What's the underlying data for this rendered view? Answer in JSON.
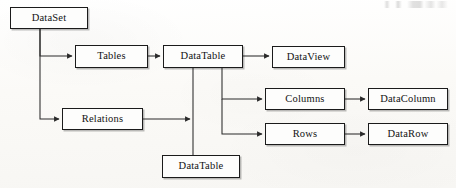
{
  "diagram": {
    "type": "block-flow-diagram",
    "nodes": [
      {
        "id": "dataset",
        "label": "DataSet",
        "x": 10,
        "y": 7,
        "w": 78,
        "h": 22
      },
      {
        "id": "tables",
        "label": "Tables",
        "x": 75,
        "y": 45,
        "w": 73,
        "h": 23
      },
      {
        "id": "datatable",
        "label": "DataTable",
        "x": 163,
        "y": 45,
        "w": 80,
        "h": 23
      },
      {
        "id": "dataview",
        "label": "DataView",
        "x": 272,
        "y": 46,
        "w": 73,
        "h": 22
      },
      {
        "id": "columns",
        "label": "Columns",
        "x": 265,
        "y": 88,
        "w": 80,
        "h": 22
      },
      {
        "id": "datacolumn",
        "label": "DataColumn",
        "x": 368,
        "y": 88,
        "w": 80,
        "h": 22
      },
      {
        "id": "relations",
        "label": "Relations",
        "x": 62,
        "y": 108,
        "w": 81,
        "h": 22
      },
      {
        "id": "rows",
        "label": "Rows",
        "x": 265,
        "y": 123,
        "w": 80,
        "h": 22
      },
      {
        "id": "datarow",
        "label": "DataRow",
        "x": 368,
        "y": 123,
        "w": 80,
        "h": 22
      },
      {
        "id": "datatable2",
        "label": "DataTable",
        "x": 162,
        "y": 155,
        "w": 78,
        "h": 23
      }
    ],
    "edges": [
      {
        "id": "dataset-to-tables",
        "from": "dataset",
        "to": "tables",
        "style": "orthogonal",
        "arrow": true
      },
      {
        "id": "dataset-to-relations",
        "from": "dataset",
        "to": "relations",
        "style": "orthogonal",
        "arrow": true
      },
      {
        "id": "tables-to-datatable",
        "from": "tables",
        "to": "datatable",
        "style": "straight",
        "arrow": true
      },
      {
        "id": "datatable-to-dataview",
        "from": "datatable",
        "to": "dataview",
        "style": "straight",
        "arrow": true
      },
      {
        "id": "datatable-to-columns",
        "from": "datatable",
        "to": "columns",
        "style": "orthogonal",
        "arrow": true
      },
      {
        "id": "datatable-to-rows",
        "from": "datatable",
        "to": "rows",
        "style": "orthogonal",
        "arrow": true
      },
      {
        "id": "columns-to-datacolumn",
        "from": "columns",
        "to": "datacolumn",
        "style": "straight",
        "arrow": true
      },
      {
        "id": "rows-to-datarow",
        "from": "rows",
        "to": "datarow",
        "style": "straight",
        "arrow": true
      },
      {
        "id": "relations-to-junction",
        "from": "relations",
        "to": "datatable2",
        "style": "orthogonal",
        "arrow": true
      },
      {
        "id": "datatable-to-datatable2",
        "from": "datatable",
        "to": "datatable2",
        "style": "straight",
        "arrow": false
      }
    ],
    "colors": {
      "page_background": "#fbfbf9",
      "node_fill": "#fdfdfc",
      "node_border": "#1b1b1b",
      "edge_stroke": "#2a2a2a",
      "text": "#121212"
    },
    "artifact_note": "illegible faint scan marks in top-right margin"
  }
}
